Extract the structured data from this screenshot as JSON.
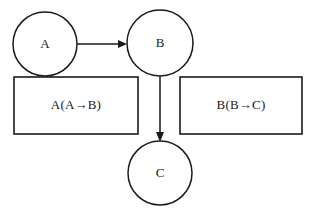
{
  "diagram": {
    "background_color": "#ffffff",
    "stroke_color": "#1a1a1a",
    "nodes": [
      {
        "id": "A",
        "label": "A",
        "shape": "circle",
        "cx": 45,
        "cy": 44,
        "r": 32
      },
      {
        "id": "B",
        "label": "B",
        "shape": "circle",
        "cx": 160,
        "cy": 43,
        "r": 33
      },
      {
        "id": "C",
        "label": "C",
        "shape": "circle",
        "cx": 160,
        "cy": 173,
        "r": 32
      }
    ],
    "boxes": [
      {
        "id": "box-left",
        "label": "A(A→B)",
        "x": 14,
        "y": 77,
        "width": 124,
        "height": 57,
        "text_cx": 76,
        "text_cy": 105
      },
      {
        "id": "box-right",
        "label": "B(B→C)",
        "x": 180,
        "y": 77,
        "width": 122,
        "height": 57,
        "text_cx": 241,
        "text_cy": 105
      }
    ],
    "edges": [
      {
        "id": "edge-a-b",
        "from": "A",
        "to": "B",
        "direction": "horizontal",
        "label": "",
        "x1": 77,
        "y1": 44,
        "x2": 127,
        "y2": 44
      },
      {
        "id": "edge-b-c",
        "from": "B",
        "to": "C",
        "direction": "vertical",
        "label": "",
        "x1": 160,
        "y1": 76,
        "x2": 160,
        "y2": 141
      }
    ]
  }
}
